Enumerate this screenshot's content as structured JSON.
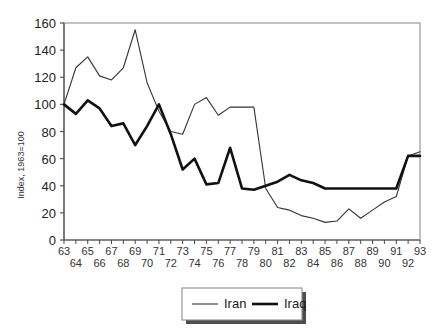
{
  "chart_data": {
    "type": "line",
    "title": "",
    "xlabel": "",
    "ylabel": "Index, 1963=100",
    "ylim": [
      0,
      160
    ],
    "ytick_values": [
      0,
      20,
      40,
      60,
      80,
      100,
      120,
      140,
      160
    ],
    "ytick_labels": [
      "0",
      "20",
      "40",
      "60",
      "80",
      "100",
      "120",
      "140",
      "160"
    ],
    "grid": false,
    "legend_position": "bottom-center",
    "x": [
      63,
      64,
      65,
      66,
      67,
      68,
      69,
      70,
      71,
      72,
      73,
      74,
      75,
      76,
      77,
      78,
      79,
      80,
      81,
      82,
      83,
      84,
      85,
      86,
      87,
      88,
      89,
      90,
      91,
      92,
      93
    ],
    "xtick_labels_upper": [
      "63",
      "",
      "65",
      "",
      "67",
      "",
      "69",
      "",
      "71",
      "",
      "73",
      "",
      "75",
      "",
      "77",
      "",
      "79",
      "",
      "81",
      "",
      "83",
      "",
      "85",
      "",
      "87",
      "",
      "89",
      "",
      "91",
      "",
      "93"
    ],
    "xtick_labels_lower": [
      "",
      "64",
      "",
      "66",
      "",
      "68",
      "",
      "70",
      "",
      "72",
      "",
      "74",
      "",
      "76",
      "",
      "78",
      "",
      "80",
      "",
      "82",
      "",
      "84",
      "",
      "86",
      "",
      "88",
      "",
      "90",
      "",
      "92",
      ""
    ],
    "series": [
      {
        "name": "Iran",
        "style": "thin",
        "color": "#333333",
        "values": [
          100,
          127,
          135,
          121,
          118,
          127,
          155,
          116,
          95,
          80,
          78,
          100,
          105,
          92,
          98,
          98,
          98,
          38,
          24,
          22,
          18,
          16,
          13,
          14,
          23,
          16,
          22,
          28,
          32,
          62,
          65
        ]
      },
      {
        "name": "Iraq",
        "style": "thick",
        "color": "#111111",
        "values": [
          100,
          93,
          103,
          97,
          84,
          86,
          70,
          84,
          100,
          78,
          52,
          60,
          41,
          42,
          68,
          38,
          37,
          40,
          43,
          48,
          44,
          42,
          38,
          38,
          38,
          38,
          38,
          38,
          38,
          62,
          62
        ]
      }
    ]
  },
  "legend": {
    "items": [
      {
        "label": "Iran"
      },
      {
        "label": "Iraq"
      }
    ]
  }
}
